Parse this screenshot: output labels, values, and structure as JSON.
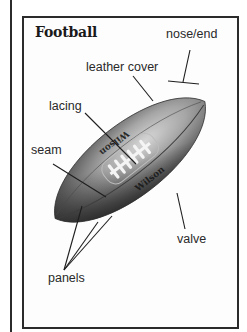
{
  "diagram": {
    "title": "Football",
    "labels": {
      "nose_end": "nose/end",
      "leather_cover": "leather cover",
      "lacing": "lacing",
      "seam": "seam",
      "valve": "valve",
      "panels": "panels"
    },
    "ball_brand_text": [
      "Wilson",
      "Wilson"
    ]
  },
  "colors": {
    "ink": "#2a2a2a",
    "frame": "#2b2b2b",
    "ball_dark": "#2e2e2e",
    "ball_mid": "#8a8a8a",
    "ball_light": "#c9c9c9",
    "lacing": "#f2f2f2"
  }
}
